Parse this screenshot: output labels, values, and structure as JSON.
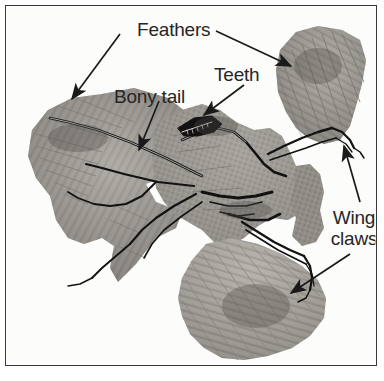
{
  "figure": {
    "kind": "fossil-photograph",
    "frame_color": "#3a3a3a",
    "background_color": "#ffffff",
    "label_text_color": "#262626"
  },
  "labels": [
    {
      "id": "feathers",
      "text": "Feathers",
      "target_count": 2,
      "targets": [
        "left wing and tail feather impressions",
        "upper right wing feather impressions"
      ]
    },
    {
      "id": "bony_tail",
      "text": "Bony tail",
      "target_count": 1,
      "targets": [
        "long bony tail vertebrae running into left feather fan"
      ]
    },
    {
      "id": "teeth",
      "text": "Teeth",
      "target_count": 1,
      "targets": [
        "toothed jaw of skull near centre of slab"
      ]
    },
    {
      "id": "wing_claws",
      "text": "Wing claws",
      "line_1": "Wing",
      "line_2": "claws",
      "target_count": 2,
      "targets": [
        "claw on upper right wing digit",
        "claw on lower wing digit"
      ]
    }
  ],
  "arrows": [
    {
      "id": "arrow-feathers-left",
      "from": [
        119,
        33
      ],
      "to": [
        70,
        97
      ],
      "head": "to"
    },
    {
      "id": "arrow-feathers-right",
      "from": [
        215,
        30
      ],
      "to": [
        289,
        64
      ],
      "head": "to"
    },
    {
      "id": "arrow-bony-tail",
      "from": [
        158,
        100
      ],
      "to": [
        138,
        148
      ],
      "head": "to"
    },
    {
      "id": "arrow-teeth",
      "from": [
        243,
        84
      ],
      "to": [
        202,
        113
      ],
      "head": "to"
    },
    {
      "id": "arrow-wing-claws-upper",
      "from": [
        359,
        200
      ],
      "to": [
        343,
        145
      ],
      "head": "to"
    },
    {
      "id": "arrow-wing-claws-lower",
      "from": [
        349,
        252
      ],
      "to": [
        289,
        291
      ],
      "head": "to"
    }
  ],
  "fossil": {
    "tone_light": "#cfcdc8",
    "tone_mid": "#a6a39d",
    "tone_dark": "#6f6c67",
    "tone_bone": "#141414",
    "regions": [
      {
        "name": "left-wing-tail-feather-fan",
        "tone": "#a8a5a0"
      },
      {
        "name": "upper-right-wing-feather-fan",
        "tone": "#a09d98"
      },
      {
        "name": "lower-wing-feather-fan",
        "tone": "#b0ada8"
      },
      {
        "name": "body-and-skull-block",
        "tone": "#9d9a95"
      }
    ]
  }
}
